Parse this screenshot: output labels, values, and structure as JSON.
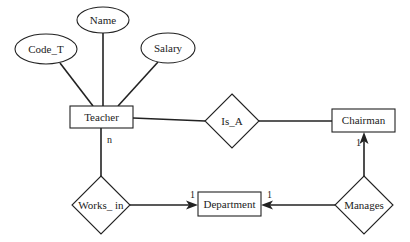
{
  "diagram": {
    "type": "er-diagram",
    "entities": [
      {
        "id": "teacher",
        "label": "Teacher"
      },
      {
        "id": "chairman",
        "label": "Chairman"
      },
      {
        "id": "department",
        "label": "Department"
      }
    ],
    "attributes": [
      {
        "id": "code_t",
        "label": "Code_T",
        "entity": "teacher"
      },
      {
        "id": "name",
        "label": "Name",
        "entity": "teacher"
      },
      {
        "id": "salary",
        "label": "Salary",
        "entity": "teacher"
      }
    ],
    "relationships": [
      {
        "id": "is_a",
        "label": "Is_A",
        "from": "teacher",
        "to": "chairman"
      },
      {
        "id": "works_in",
        "label": "Works_ in",
        "from": "teacher",
        "to": "department"
      },
      {
        "id": "manages",
        "label": "Manages",
        "from": "chairman",
        "to": "department"
      }
    ],
    "cardinalities": {
      "teacher_works_in": "n",
      "works_in_department": "1",
      "manages_department": "1",
      "manages_chairman": "1"
    }
  },
  "colors": {
    "line": "#222222",
    "background": "#ffffff"
  }
}
